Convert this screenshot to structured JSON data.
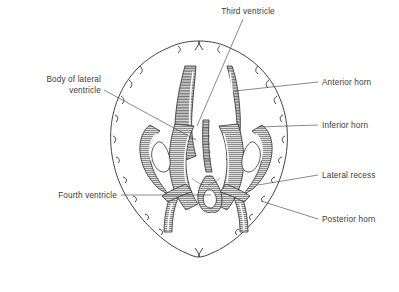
{
  "figure": {
    "background_color": "#ffffff",
    "outline_color": "#2e2e2e",
    "ventricle_fill_color": "#e9e9e9",
    "text_color": "#3b3b3b",
    "leader_color": "#4a4a4a"
  },
  "labels": [
    {
      "id": "third-ventricle",
      "text": "Third ventricle",
      "lines": [
        "Third ventricle"
      ],
      "side": "top",
      "text_x": 248,
      "text_y": 14,
      "anchor": "middle",
      "leader": "M 243 19 L 197 126"
    },
    {
      "id": "body-of-lateral-ventricle",
      "text": "Body of lateral ventricle",
      "lines": [
        "Body of lateral",
        "ventricle"
      ],
      "side": "left",
      "text_x": 101,
      "text_y": 82,
      "anchor": "end",
      "leader": "M 104 90 L 196 140"
    },
    {
      "id": "fourth-ventricle",
      "text": "Fourth ventricle",
      "lines": [
        "Fourth ventricle"
      ],
      "side": "left",
      "text_x": 117,
      "text_y": 198,
      "anchor": "end",
      "leader": "M 121 195 L 211 195"
    },
    {
      "id": "anterior-horn",
      "text": "Anterior horn",
      "lines": [
        "Anterior horn"
      ],
      "side": "right",
      "text_x": 322,
      "text_y": 85,
      "anchor": "start",
      "leader": "M 318 82 L 235 91"
    },
    {
      "id": "inferior-horn",
      "text": "Inferior horn",
      "lines": [
        "Inferior horn"
      ],
      "side": "right",
      "text_x": 322,
      "text_y": 128,
      "anchor": "start",
      "leader": "M 318 125 L 258 127"
    },
    {
      "id": "lateral-recess",
      "text": "Lateral recess",
      "lines": [
        "Lateral recess"
      ],
      "side": "right",
      "text_x": 322,
      "text_y": 178,
      "anchor": "start",
      "leader": "M 318 175 L 258 185"
    },
    {
      "id": "posterior-horn",
      "text": "Posterior horn",
      "lines": [
        "Posterior horn"
      ],
      "side": "right",
      "text_x": 322,
      "text_y": 222,
      "anchor": "start",
      "leader": "M 318 219 L 261 201"
    }
  ],
  "structures": [
    {
      "id": "brain-outline",
      "name": "cerebral hemispheres outline"
    },
    {
      "id": "left-anterior-horn",
      "name": "left anterior horn"
    },
    {
      "id": "right-anterior-horn",
      "name": "right anterior horn"
    },
    {
      "id": "left-lateral-ventricle-body",
      "name": "left lateral ventricle body"
    },
    {
      "id": "right-lateral-ventricle-body",
      "name": "right lateral ventricle body"
    },
    {
      "id": "left-inferior-horn",
      "name": "left inferior horn"
    },
    {
      "id": "right-inferior-horn",
      "name": "right inferior horn"
    },
    {
      "id": "left-posterior-horn",
      "name": "left posterior horn"
    },
    {
      "id": "right-posterior-horn",
      "name": "right posterior horn"
    },
    {
      "id": "third-ventricle-channel",
      "name": "third ventricle"
    },
    {
      "id": "fourth-ventricle-body",
      "name": "fourth ventricle"
    },
    {
      "id": "left-lateral-recess",
      "name": "left lateral recess"
    },
    {
      "id": "right-lateral-recess",
      "name": "right lateral recess"
    }
  ]
}
